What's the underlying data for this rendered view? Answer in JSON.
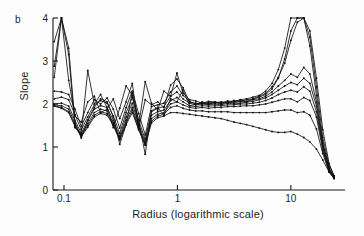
{
  "panel": {
    "label": "b"
  },
  "chart_data": {
    "type": "line",
    "title": "",
    "xlabel": "Radius (logarithmic scale)",
    "ylabel": "Slope",
    "xscale": "log",
    "xlim": [
      0.08,
      30
    ],
    "ylim": [
      0,
      4
    ],
    "xticks": [
      0.1,
      1,
      10
    ],
    "xtick_labels": [
      "0.1",
      "1",
      "10"
    ],
    "yticks": [
      0,
      1,
      2,
      3,
      4
    ],
    "ytick_labels": [
      "0",
      "1",
      "2",
      "3",
      "4"
    ],
    "grid": false,
    "legend": "none",
    "marker": "point",
    "line_color": "#111111",
    "series": [
      {
        "name": "curve-1",
        "x": [
          0.082,
          0.095,
          0.11,
          0.125,
          0.142,
          0.162,
          0.185,
          0.21,
          0.24,
          0.272,
          0.31,
          0.353,
          0.4,
          0.455,
          0.52,
          0.59,
          0.67,
          0.76,
          0.87,
          0.99,
          1.12,
          1.28,
          1.45,
          1.65,
          1.88,
          2.14,
          2.43,
          2.77,
          3.15,
          3.58,
          4.07,
          4.63,
          5.27,
          5.99,
          6.82,
          7.75,
          8.82,
          10.0,
          11.4,
          13.0,
          14.7,
          16.8,
          19.1,
          21.7,
          24.0
        ],
        "y": [
          3.45,
          4.0,
          3.3,
          1.55,
          1.21,
          1.62,
          1.92,
          2.12,
          2.05,
          1.7,
          1.06,
          1.52,
          2.28,
          1.62,
          0.83,
          1.84,
          1.92,
          1.74,
          2.12,
          2.05,
          2.33,
          1.96,
          1.99,
          2.05,
          2.0,
          2.03,
          2.02,
          2.04,
          2.05,
          2.08,
          2.06,
          2.12,
          2.16,
          2.22,
          2.35,
          2.6,
          3.05,
          3.7,
          4.0,
          4.0,
          3.7,
          2.6,
          1.4,
          0.62,
          0.33
        ]
      },
      {
        "name": "curve-2",
        "x": [
          0.082,
          0.095,
          0.11,
          0.125,
          0.142,
          0.162,
          0.185,
          0.21,
          0.24,
          0.272,
          0.31,
          0.353,
          0.4,
          0.455,
          0.52,
          0.59,
          0.67,
          0.76,
          0.87,
          0.99,
          1.12,
          1.28,
          1.45,
          1.65,
          1.88,
          2.14,
          2.43,
          2.77,
          3.15,
          3.58,
          4.07,
          4.63,
          5.27,
          5.99,
          6.82,
          7.75,
          8.82,
          10.0,
          11.4,
          13.0,
          14.7,
          16.8,
          19.1,
          21.7,
          24.0
        ],
        "y": [
          2.88,
          4.0,
          3.15,
          1.45,
          1.3,
          2.78,
          2.0,
          2.22,
          1.92,
          1.45,
          1.9,
          2.42,
          2.2,
          1.5,
          2.52,
          2.02,
          1.86,
          2.3,
          2.18,
          2.72,
          2.25,
          2.1,
          2.07,
          2.02,
          2.06,
          2.05,
          2.03,
          2.07,
          2.06,
          2.1,
          2.12,
          2.16,
          2.2,
          2.3,
          2.48,
          2.8,
          3.3,
          4.0,
          4.0,
          4.0,
          3.55,
          2.4,
          1.22,
          0.58,
          0.33
        ]
      },
      {
        "name": "curve-3",
        "x": [
          0.082,
          0.095,
          0.11,
          0.125,
          0.142,
          0.162,
          0.185,
          0.21,
          0.24,
          0.272,
          0.31,
          0.353,
          0.4,
          0.455,
          0.52,
          0.59,
          0.67,
          0.76,
          0.87,
          0.99,
          1.12,
          1.28,
          1.45,
          1.65,
          1.88,
          2.14,
          2.43,
          2.77,
          3.15,
          3.58,
          4.07,
          4.63,
          5.27,
          5.99,
          6.82,
          7.75,
          8.82,
          10.0,
          11.4,
          13.0,
          14.7,
          16.8,
          19.1,
          21.7,
          24.0
        ],
        "y": [
          2.62,
          4.0,
          2.55,
          1.72,
          1.58,
          2.05,
          2.18,
          1.8,
          1.88,
          2.12,
          1.66,
          2.05,
          2.48,
          1.42,
          2.1,
          1.98,
          2.05,
          1.92,
          2.44,
          2.58,
          2.38,
          2.04,
          2.02,
          2.0,
          2.04,
          2.02,
          2.05,
          2.02,
          2.08,
          2.06,
          2.1,
          2.12,
          2.18,
          2.25,
          2.4,
          2.62,
          2.95,
          3.48,
          3.9,
          4.0,
          3.35,
          2.2,
          1.1,
          0.52,
          0.31
        ]
      },
      {
        "name": "curve-4",
        "x": [
          0.082,
          0.095,
          0.11,
          0.125,
          0.142,
          0.162,
          0.185,
          0.21,
          0.24,
          0.272,
          0.31,
          0.353,
          0.4,
          0.455,
          0.52,
          0.59,
          0.67,
          0.76,
          0.87,
          0.99,
          1.12,
          1.28,
          1.45,
          1.65,
          1.88,
          2.14,
          2.43,
          2.77,
          3.15,
          3.58,
          4.07,
          4.63,
          5.27,
          5.99,
          6.82,
          7.75,
          8.82,
          10.0,
          11.4,
          13.0,
          14.7,
          16.8,
          19.1,
          21.7,
          24.0
        ],
        "y": [
          2.3,
          2.28,
          2.22,
          1.88,
          1.48,
          1.8,
          2.1,
          2.0,
          2.14,
          1.88,
          1.44,
          1.92,
          2.3,
          1.78,
          1.28,
          1.94,
          1.98,
          2.02,
          2.28,
          2.42,
          2.2,
          2.06,
          2.0,
          2.02,
          2.0,
          2.04,
          2.0,
          2.05,
          2.02,
          2.06,
          2.05,
          2.1,
          2.12,
          2.18,
          2.28,
          2.42,
          2.55,
          2.7,
          2.62,
          2.85,
          2.7,
          2.05,
          1.08,
          0.5,
          0.3
        ]
      },
      {
        "name": "curve-5",
        "x": [
          0.082,
          0.095,
          0.11,
          0.125,
          0.142,
          0.162,
          0.185,
          0.21,
          0.24,
          0.272,
          0.31,
          0.353,
          0.4,
          0.455,
          0.52,
          0.59,
          0.67,
          0.76,
          0.87,
          0.99,
          1.12,
          1.28,
          1.45,
          1.65,
          1.88,
          2.14,
          2.43,
          2.77,
          3.15,
          3.58,
          4.07,
          4.63,
          5.27,
          5.99,
          6.82,
          7.75,
          8.82,
          10.0,
          11.4,
          13.0,
          14.7,
          16.8,
          19.1,
          21.7,
          24.0
        ],
        "y": [
          2.12,
          2.16,
          2.1,
          1.75,
          1.4,
          1.7,
          1.98,
          2.08,
          2.02,
          1.72,
          1.32,
          1.8,
          2.15,
          1.62,
          1.18,
          1.82,
          1.9,
          1.94,
          2.18,
          2.28,
          2.12,
          2.02,
          1.98,
          2.0,
          1.98,
          2.0,
          1.98,
          2.02,
          2.0,
          2.02,
          2.04,
          2.06,
          2.1,
          2.14,
          2.22,
          2.32,
          2.42,
          2.5,
          2.45,
          2.6,
          2.48,
          1.95,
          1.02,
          0.48,
          0.29
        ]
      },
      {
        "name": "curve-6",
        "x": [
          0.082,
          0.095,
          0.11,
          0.125,
          0.142,
          0.162,
          0.185,
          0.21,
          0.24,
          0.272,
          0.31,
          0.353,
          0.4,
          0.455,
          0.52,
          0.59,
          0.67,
          0.76,
          0.87,
          0.99,
          1.12,
          1.28,
          1.45,
          1.65,
          1.88,
          2.14,
          2.43,
          2.77,
          3.15,
          3.58,
          4.07,
          4.63,
          5.27,
          5.99,
          6.82,
          7.75,
          8.82,
          10.0,
          11.4,
          13.0,
          14.7,
          16.8,
          19.1,
          21.7,
          24.0
        ],
        "y": [
          2.0,
          2.02,
          1.95,
          1.62,
          1.32,
          1.62,
          1.88,
          1.96,
          1.92,
          1.62,
          1.25,
          1.7,
          2.02,
          1.52,
          1.12,
          1.74,
          1.82,
          1.86,
          2.08,
          2.15,
          2.05,
          1.96,
          1.94,
          1.96,
          1.95,
          1.96,
          1.96,
          1.98,
          1.98,
          2.0,
          2.0,
          2.02,
          2.04,
          2.08,
          2.14,
          2.22,
          2.28,
          2.32,
          2.28,
          2.4,
          2.3,
          1.82,
          0.98,
          0.46,
          0.28
        ]
      },
      {
        "name": "curve-7",
        "x": [
          0.082,
          0.095,
          0.11,
          0.125,
          0.142,
          0.162,
          0.185,
          0.21,
          0.24,
          0.272,
          0.31,
          0.353,
          0.4,
          0.455,
          0.52,
          0.59,
          0.67,
          0.76,
          0.87,
          0.99,
          1.12,
          1.28,
          1.45,
          1.65,
          1.88,
          2.14,
          2.43,
          2.77,
          3.15,
          3.58,
          4.07,
          4.63,
          5.27,
          5.99,
          6.82,
          7.75,
          8.82,
          10.0,
          11.4,
          13.0,
          14.7,
          16.8,
          19.1,
          21.7,
          24.0
        ],
        "y": [
          1.98,
          1.96,
          1.88,
          1.55,
          1.28,
          1.55,
          1.8,
          1.88,
          1.84,
          1.56,
          1.2,
          1.62,
          1.92,
          1.46,
          1.08,
          1.66,
          1.76,
          1.8,
          2.0,
          2.05,
          1.98,
          1.92,
          1.9,
          1.92,
          1.9,
          1.92,
          1.92,
          1.94,
          1.94,
          1.95,
          1.96,
          1.96,
          1.98,
          2.0,
          2.04,
          2.08,
          2.12,
          2.12,
          2.05,
          2.15,
          2.08,
          1.7,
          0.92,
          0.44,
          0.27
        ]
      },
      {
        "name": "curve-8",
        "x": [
          0.082,
          0.095,
          0.11,
          0.125,
          0.142,
          0.162,
          0.185,
          0.21,
          0.24,
          0.272,
          0.31,
          0.353,
          0.4,
          0.455,
          0.52,
          0.59,
          0.67,
          0.76,
          0.87,
          0.99,
          1.12,
          1.28,
          1.45,
          1.65,
          1.88,
          2.14,
          2.43,
          2.77,
          3.15,
          3.58,
          4.07,
          4.63,
          5.27,
          5.99,
          6.82,
          7.75,
          8.82,
          10.0,
          11.4,
          13.0,
          14.7,
          16.8,
          19.1,
          21.7,
          24.0
        ],
        "y": [
          1.96,
          1.92,
          1.82,
          1.5,
          1.26,
          1.5,
          1.74,
          1.82,
          1.78,
          1.52,
          1.18,
          1.56,
          1.86,
          1.42,
          1.05,
          1.6,
          1.72,
          1.76,
          1.92,
          1.96,
          1.9,
          1.86,
          1.84,
          1.84,
          1.82,
          1.82,
          1.82,
          1.82,
          1.8,
          1.8,
          1.8,
          1.8,
          1.8,
          1.8,
          1.82,
          1.84,
          1.86,
          1.86,
          1.8,
          1.82,
          1.74,
          1.42,
          0.85,
          0.42,
          0.27
        ]
      },
      {
        "name": "curve-9",
        "x": [
          0.082,
          0.095,
          0.11,
          0.125,
          0.142,
          0.162,
          0.185,
          0.21,
          0.24,
          0.272,
          0.31,
          0.353,
          0.4,
          0.455,
          0.52,
          0.59,
          0.67,
          0.76,
          0.87,
          0.99,
          1.12,
          1.28,
          1.45,
          1.65,
          1.88,
          2.14,
          2.43,
          2.77,
          3.15,
          3.58,
          4.07,
          4.63,
          5.27,
          5.99,
          6.82,
          7.75,
          8.82,
          10.0,
          11.4,
          13.0,
          14.7,
          16.8,
          19.1,
          21.7,
          24.0
        ],
        "y": [
          1.95,
          1.9,
          1.8,
          1.48,
          1.24,
          1.46,
          1.7,
          1.78,
          1.74,
          1.5,
          1.16,
          1.52,
          1.8,
          1.4,
          1.04,
          1.56,
          1.68,
          1.72,
          1.8,
          1.8,
          1.78,
          1.76,
          1.74,
          1.72,
          1.7,
          1.68,
          1.66,
          1.62,
          1.58,
          1.55,
          1.52,
          1.48,
          1.44,
          1.4,
          1.36,
          1.34,
          1.34,
          1.36,
          1.3,
          1.22,
          1.12,
          0.95,
          0.7,
          0.42,
          0.27
        ]
      }
    ]
  }
}
